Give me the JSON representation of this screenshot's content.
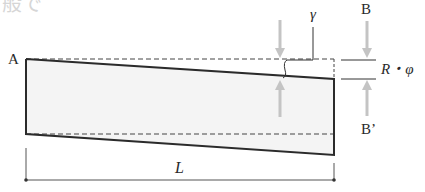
{
  "header_fragment": "般で",
  "labels": {
    "point_a": "A",
    "point_b": "B",
    "point_b_prime": "B’",
    "gamma": "γ",
    "r_phi": "R・φ",
    "length": "L"
  },
  "colors": {
    "outline": "#2b2b2b",
    "fill": "#f4f4f4",
    "dashed": "#444444",
    "arrow": "#c4c4c4",
    "text": "#2a2a2a"
  }
}
